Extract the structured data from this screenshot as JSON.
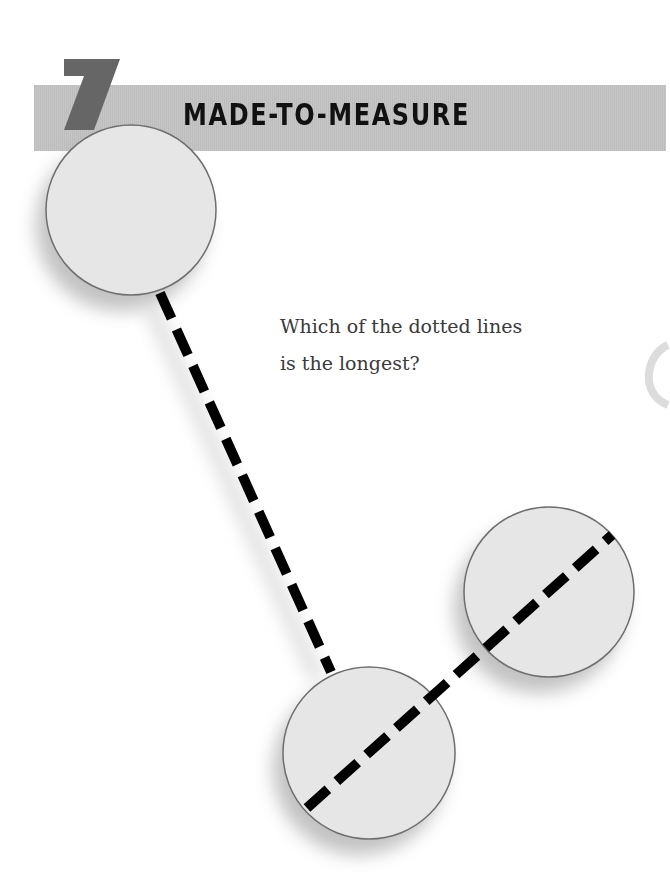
{
  "puzzle": {
    "number": "7",
    "title": "MADE-TO-MEASURE",
    "question_line1": "Which of the dotted lines",
    "question_line2": "is the longest?"
  },
  "colors": {
    "band": "#c2c2c2",
    "number": "#666666",
    "circle_fill": "#e6e6e6",
    "circle_stroke": "#6e6e6e",
    "dash": "#000000"
  },
  "figure": {
    "circles": [
      {
        "id": "top-left",
        "cx": 131,
        "cy": 210,
        "r": 85
      },
      {
        "id": "bottom",
        "cx": 369,
        "cy": 753,
        "r": 86
      },
      {
        "id": "right",
        "cx": 549,
        "cy": 592,
        "r": 85
      }
    ],
    "dotted_lines": [
      {
        "id": "line-a",
        "x1": 160,
        "y1": 293,
        "x2": 331,
        "y2": 672
      },
      {
        "id": "line-b",
        "x1": 307,
        "y1": 808,
        "x2": 612,
        "y2": 535
      }
    ]
  }
}
